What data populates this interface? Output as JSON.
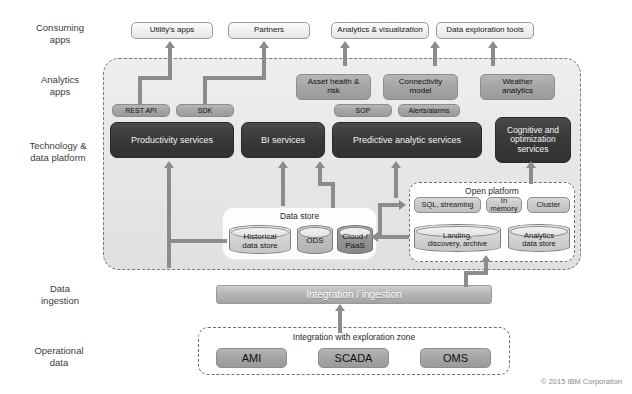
{
  "diagram": {
    "footer": "© 2015 IBM Corporation",
    "accent_dark": "#353535",
    "accent_mid": "#a5a5a5",
    "connector_color": "#8c8c8c"
  },
  "row_labels": [
    {
      "id": "consuming-apps",
      "text": "Consuming\napps"
    },
    {
      "id": "analytics-apps",
      "text": "Analytics\napps"
    },
    {
      "id": "technology-data-platform",
      "text": "Technology &\ndata platform"
    },
    {
      "id": "data-ingestion",
      "text": "Data\ningestion"
    },
    {
      "id": "operational-data",
      "text": "Operational\ndata"
    }
  ],
  "consuming_apps": [
    {
      "id": "utilitys-apps",
      "label": "Utility's apps"
    },
    {
      "id": "partners",
      "label": "Partners"
    },
    {
      "id": "analytics-visualization",
      "label": "Analytics & visualization"
    },
    {
      "id": "data-exploration-tools",
      "label": "Data exploration tools"
    }
  ],
  "analytics_apps": [
    {
      "id": "asset-health-risk",
      "label": "Asset health &\nrisk"
    },
    {
      "id": "connectivity-model",
      "label": "Connectivity\nmodel"
    },
    {
      "id": "weather-analytics",
      "label": "Weather\nanalytics"
    }
  ],
  "interfaces": [
    {
      "id": "rest-api",
      "label": "REST API"
    },
    {
      "id": "sdk",
      "label": "SDK"
    },
    {
      "id": "sop",
      "label": "SOP"
    },
    {
      "id": "alerts-alarms",
      "label": "Alerts/alarms"
    }
  ],
  "services": [
    {
      "id": "productivity-services",
      "label": "Productivity services"
    },
    {
      "id": "bi-services",
      "label": "BI services"
    },
    {
      "id": "predictive-analytic-services",
      "label": "Predictive analytic services"
    },
    {
      "id": "cognitive-optimization-services",
      "label": "Cognitive and\noptimization\nservices"
    }
  ],
  "data_store": {
    "title": "Data store",
    "items": [
      {
        "id": "historical-data-store",
        "label": "Historical\ndata store"
      },
      {
        "id": "ods",
        "label": "ODS"
      },
      {
        "id": "cloud-paas",
        "label": "Cloud /\nPaaS"
      }
    ]
  },
  "open_platform": {
    "title": "Open platform",
    "engines": [
      {
        "id": "sql-streaming",
        "label": "SQL, streaming"
      },
      {
        "id": "in-memory",
        "label": "In\nmemory"
      },
      {
        "id": "cluster",
        "label": "Cluster"
      }
    ],
    "stores": [
      {
        "id": "landing-discovery-archive",
        "label": "Landing,\ndiscovery, archive"
      },
      {
        "id": "analytics-data-store",
        "label": "Analytics\ndata store"
      }
    ]
  },
  "ingestion": {
    "label": "Integration / ingestion"
  },
  "operational_zone": {
    "title": "Integration with exploration zone",
    "sources": [
      {
        "id": "ami",
        "label": "AMI"
      },
      {
        "id": "scada",
        "label": "SCADA"
      },
      {
        "id": "oms",
        "label": "OMS"
      }
    ]
  }
}
